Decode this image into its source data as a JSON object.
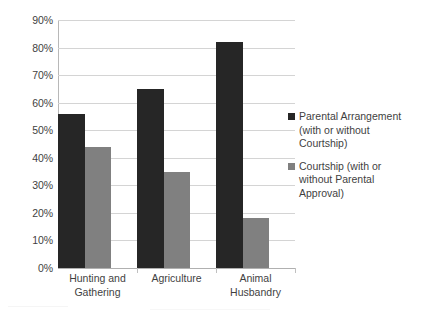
{
  "chart_data": {
    "type": "bar",
    "title": "",
    "subtitle": "",
    "xlabel": "",
    "ylabel": "",
    "categories": [
      "Hunting and Gathering",
      "Agriculture",
      "Animal Husbandry"
    ],
    "series": [
      {
        "name": "Parental Arrangement (with or without Courtship)",
        "color": "#262626",
        "values": [
          56,
          65,
          82
        ]
      },
      {
        "name": "Courtship (with or without Parental Approval)",
        "color": "#808080",
        "values": [
          44,
          35,
          18
        ]
      }
    ],
    "ylim": [
      0,
      90
    ],
    "ytick_step": 10,
    "ytick_labels": [
      "90%",
      "80%",
      "70%",
      "60%",
      "50%",
      "40%",
      "30%",
      "20%",
      "10%",
      "0%"
    ],
    "ytick_values": [
      90,
      80,
      70,
      60,
      50,
      40,
      30,
      20,
      10,
      0
    ],
    "value_suffix": "%",
    "grid": true,
    "legend_position": "right"
  },
  "axis": {
    "y_ticks": [
      {
        "label": "90%",
        "value": 90
      },
      {
        "label": "80%",
        "value": 80
      },
      {
        "label": "70%",
        "value": 70
      },
      {
        "label": "60%",
        "value": 60
      },
      {
        "label": "50%",
        "value": 50
      },
      {
        "label": "40%",
        "value": 40
      },
      {
        "label": "30%",
        "value": 30
      },
      {
        "label": "20%",
        "value": 20
      },
      {
        "label": "10%",
        "value": 10
      },
      {
        "label": "0%",
        "value": 0
      }
    ],
    "x_categories": [
      {
        "line1": "Hunting and",
        "line2": "Gathering"
      },
      {
        "line1": "Agriculture",
        "line2": ""
      },
      {
        "line1": "Animal Husbandry",
        "line2": ""
      }
    ]
  },
  "legend": {
    "items": [
      {
        "line1": "Parental Arrangement",
        "line2": "(with or without",
        "line3": "Courtship)",
        "color": "#262626"
      },
      {
        "line1": "Courtship (with or",
        "line2": "without Parental",
        "line3": "Approval)",
        "color": "#808080"
      }
    ]
  },
  "colors": {
    "series_dark": "#262626",
    "series_gray": "#808080",
    "gridline": "#d4d4d4",
    "axis": "#b8b8b8",
    "text": "#3f3f3f",
    "background": "#ffffff"
  }
}
